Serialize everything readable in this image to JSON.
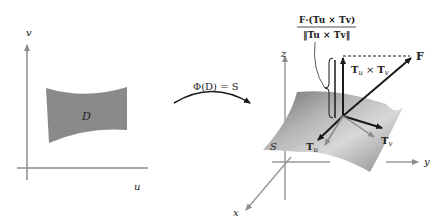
{
  "left_panel": {
    "axis_v_label": "v",
    "axis_u_label": "u",
    "region_label": "D"
  },
  "mapping": {
    "label": "Φ(D) = S"
  },
  "right_panel": {
    "axis_z_label": "z",
    "axis_y_label": "y",
    "axis_x_label": "x",
    "surface_label": "S",
    "vector_F_label": "F",
    "normal_label_T": "T",
    "normal_label_u": "u",
    "normal_label_cross": "×",
    "normal_label_v": "v",
    "tangent_u_label": "T",
    "tangent_u_sub": "u",
    "tangent_v_label": "T",
    "tangent_v_sub": "v",
    "formula_numerator": "F·(Tu × Tv)",
    "formula_denominator": "‖Tu × Tv‖"
  },
  "colors": {
    "region_fill": "#8a8a8a",
    "axis_gray": "#9a9a9a",
    "arrow_dark": "#1a1a1a",
    "surface_light": "#c8c8c8",
    "surface_dark": "#7a7a7a"
  }
}
